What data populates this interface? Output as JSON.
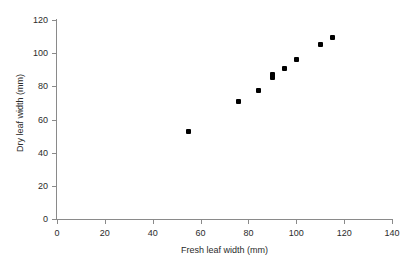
{
  "chart_data": {
    "type": "scatter",
    "title": "",
    "xlabel": "Fresh leaf width (mm)",
    "ylabel": "Dry leaf width (mm)",
    "xlim": [
      0,
      140
    ],
    "ylim": [
      0,
      120
    ],
    "xticks": [
      0,
      20,
      40,
      60,
      80,
      100,
      120,
      140
    ],
    "yticks": [
      0,
      20,
      40,
      60,
      80,
      100,
      120
    ],
    "grid": false,
    "legend": false,
    "marker": "filled-diamond",
    "marker_color": "#000000",
    "axis_color": "#8a8a8a",
    "background": "#ffffff",
    "points": [
      {
        "x": 55,
        "y": 52.5
      },
      {
        "x": 76,
        "y": 71
      },
      {
        "x": 84,
        "y": 77.5
      },
      {
        "x": 90,
        "y": 87
      },
      {
        "x": 90,
        "y": 85.5
      },
      {
        "x": 95,
        "y": 90.5
      },
      {
        "x": 100,
        "y": 96
      },
      {
        "x": 110,
        "y": 105
      },
      {
        "x": 115,
        "y": 109.5
      }
    ]
  }
}
